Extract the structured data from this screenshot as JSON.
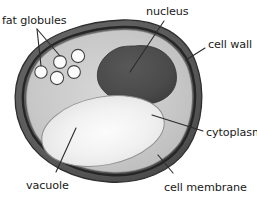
{
  "figure": {
    "background_color": "#ffffff"
  },
  "labels": {
    "fat_globules": "fat globules",
    "nucleus": "nucleus",
    "cell_wall": "cell wall",
    "cytoplasm": "cytoplasm",
    "cell_membrane": "cell membrane",
    "vacuole": "vacuole"
  },
  "colors": {
    "outline": "#3a3a3a",
    "cell_wall_outer": "#5e5e5e",
    "cell_wall_inner": "#8c8c8c",
    "cytoplasm": "#c9c9c9",
    "nucleus": "#4a4a4a",
    "vacuole": "#f2f2f2",
    "globule_fill": "#ffffff",
    "globule_stroke": "#4a4a4a",
    "leader_line": "#2b2b2b",
    "text": "#1a1a1a"
  },
  "structures": [
    {
      "name": "cell-wall",
      "label": "cell wall",
      "description": "outer dark banded ring enclosing the cell"
    },
    {
      "name": "cell-membrane",
      "label": "cell membrane",
      "description": "thin dark line just inside the cell wall"
    },
    {
      "name": "cytoplasm",
      "label": "cytoplasm",
      "description": "light grey interior matrix"
    },
    {
      "name": "nucleus",
      "label": "nucleus",
      "description": "large dark grey rounded mass upper right"
    },
    {
      "name": "vacuole",
      "label": "vacuole",
      "description": "large pale ellipse occupying lower half"
    },
    {
      "name": "fat-globules",
      "label": "fat globules",
      "description": "five small white circles upper left",
      "count": 5
    }
  ],
  "fat_globules": [
    {
      "cx": 41,
      "cy": 72,
      "r": 6.2
    },
    {
      "cx": 60,
      "cy": 62,
      "r": 6.4
    },
    {
      "cx": 78,
      "cy": 57,
      "r": 6.6
    },
    {
      "cx": 57,
      "cy": 78,
      "r": 6.6
    },
    {
      "cx": 74,
      "cy": 72,
      "r": 6.4
    }
  ]
}
